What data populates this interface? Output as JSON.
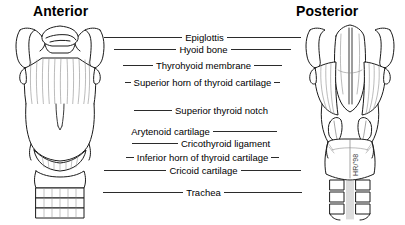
{
  "figure": {
    "titles": {
      "left": "Anterior",
      "right": "Posterior"
    },
    "watermark": "HR/'98"
  },
  "labels": [
    {
      "text": "Epiglottis",
      "top": 31,
      "left_leader": 78,
      "right_leader": 74
    },
    {
      "text": "Hyoid bone",
      "top": 43,
      "left_leader": 62,
      "right_leader": 60
    },
    {
      "text": "Thyrohyoid membrane",
      "top": 59,
      "left_leader": 30,
      "right_leader": 28
    },
    {
      "text": "Superior horn of thyroid cartilage",
      "top": 76,
      "left_leader": 6,
      "right_leader": 6
    },
    {
      "text": "Superior thyroid notch",
      "top": 104,
      "left_leader": 38,
      "right_leader": 0
    },
    {
      "text": "Arytenoid cartilage",
      "top": 125,
      "left_leader": 0,
      "right_leader": 64
    },
    {
      "text": "Cricothyroid ligament",
      "top": 137,
      "left_leader": 46,
      "right_leader": 0
    },
    {
      "text": "Inferior horn of thyroid cartilage",
      "top": 151,
      "left_leader": 8,
      "right_leader": 8
    },
    {
      "text": "Cricoid cartilage",
      "top": 164,
      "left_leader": 62,
      "right_leader": 60
    },
    {
      "text": "Trachea",
      "top": 186,
      "left_leader": 80,
      "right_leader": 78
    }
  ]
}
